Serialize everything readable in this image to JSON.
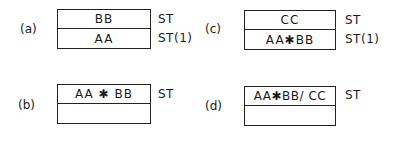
{
  "panels": [
    {
      "label": "(a)",
      "cells": [
        "BB",
        "AA"
      ],
      "registers": [
        "ST",
        "ST(1)"
      ]
    },
    {
      "label": "(b)",
      "cells": [
        "AA ✱ BB",
        ""
      ],
      "registers": [
        "ST"
      ]
    },
    {
      "label": "(c)",
      "cells": [
        "CC",
        "AA✱BB"
      ],
      "registers": [
        "ST",
        "ST(1)"
      ]
    },
    {
      "label": "(d)",
      "cells": [
        "AA✱BB/ CC",
        ""
      ],
      "registers": [
        "ST"
      ]
    }
  ]
}
